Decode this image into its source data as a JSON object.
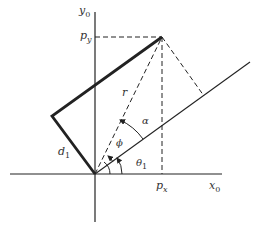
{
  "diagram": {
    "type": "robot-arm-geometry",
    "colors": {
      "line": "#222222",
      "label": "#333333",
      "background": "#ffffff"
    },
    "labels": {
      "y_axis": "y",
      "y_axis_sub": "0",
      "x_axis": "x",
      "x_axis_sub": "0",
      "py": "p",
      "py_sub": "y",
      "px": "p",
      "px_sub": "x",
      "r": "r",
      "alpha": "α",
      "phi": "ϕ",
      "theta": "θ",
      "theta_sub": "1",
      "d": "d",
      "d_sub": "1"
    }
  }
}
